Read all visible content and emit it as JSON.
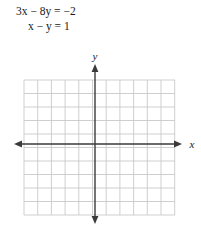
{
  "equations": {
    "line1": "3x − 8y = −2",
    "line2": "x − y = 1"
  },
  "graph": {
    "x_axis_label": "x",
    "y_axis_label": "y",
    "grid_color": "#c9c9c9",
    "axis_color": "#3a3a3a",
    "background": "#ffffff",
    "grid": {
      "columns": 11,
      "rows": 10,
      "cell_width": 13.7,
      "cell_height": 13.5,
      "left": 24,
      "top": 36,
      "right": 175,
      "bottom": 171
    },
    "origin": {
      "x": 95,
      "y": 100
    },
    "x_axis": {
      "start_x": 14,
      "end_x": 182,
      "y": 100
    },
    "y_axis": {
      "x": 95,
      "start_y": 20,
      "end_y": 180
    }
  }
}
